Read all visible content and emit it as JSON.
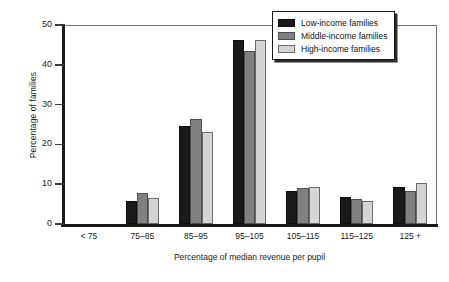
{
  "chart_data": {
    "type": "bar",
    "title": "",
    "subtitle": "",
    "xlabel": "Percentage of median revenue per pupil",
    "ylabel": "Percentage of families",
    "categories": [
      "< 75",
      "75–85",
      "85–95",
      "95–105",
      "105–115",
      "115–125",
      "125 +"
    ],
    "series": [
      {
        "name": "Low-income families",
        "color": "#1a1a1a",
        "values": [
          0,
          5.8,
          24.6,
          46.3,
          8.3,
          6.8,
          9.2
        ]
      },
      {
        "name": "Middle-income families",
        "color": "#808080",
        "values": [
          0,
          7.8,
          26.3,
          43.5,
          9.0,
          6.2,
          8.2
        ]
      },
      {
        "name": "High-income families",
        "color": "#d4d4d4",
        "values": [
          0,
          6.5,
          23.2,
          46.3,
          9.2,
          5.9,
          10.2
        ]
      }
    ],
    "ylim": [
      0,
      50
    ],
    "yticks": [
      0,
      10,
      20,
      30,
      40,
      50
    ],
    "ytick_labels": [
      "0",
      "10",
      "20",
      "30",
      "40",
      "50"
    ],
    "grid": false,
    "legend_position": "top-right"
  }
}
